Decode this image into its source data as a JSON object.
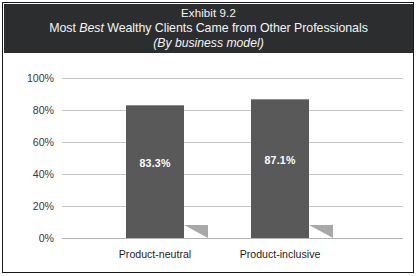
{
  "exhibit": {
    "number_line": "Exhibit 9.2",
    "title_before_em": "Most ",
    "title_em": "Best",
    "title_after_em": " Wealthy Clients Came from Other Professionals",
    "subtitle": "(By business model)"
  },
  "colors": {
    "band_background": "#2c2d2f",
    "band_text": "#f4f4f4",
    "bar_fill": "#595959",
    "bar_shadow": "#a8a8a8",
    "gridline": "#c6c6c6",
    "frame": "#18191b",
    "canvas": "#ffffff",
    "bar_label_text": "#ffffff",
    "axis_text": "#3a3a3a"
  },
  "chart_data": {
    "type": "bar",
    "subtitle": "(By business model)",
    "xlabel": "",
    "ylabel": "",
    "categories": [
      "Product-neutral",
      "Product-inclusive"
    ],
    "values": [
      83.3,
      87.1
    ],
    "value_labels": [
      "83.3%",
      "87.1%"
    ],
    "ylim": [
      0,
      100
    ],
    "ytick_values": [
      0,
      20,
      40,
      60,
      80,
      100
    ],
    "ytick_labels": [
      "0%",
      "20%",
      "40%",
      "60%",
      "80%",
      "100%"
    ],
    "grid": true,
    "legend": false,
    "legend_position": "none",
    "series": [
      {
        "name": "Share of best wealthy clients from other professionals",
        "values": [
          83.3,
          87.1
        ]
      }
    ]
  }
}
